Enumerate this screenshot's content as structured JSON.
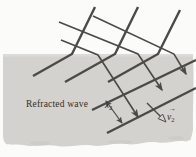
{
  "figure": {
    "background_label": "Refracted wave",
    "wavelength": {
      "symbol": "λ",
      "subscript": "2"
    },
    "velocity": {
      "symbol": "v",
      "subscript": "2",
      "vector_arrow": "→"
    },
    "colors": {
      "medium_fill": "#d3d2ce",
      "medium_top_edge": "#dcdbd7",
      "line": "#4b4a47",
      "text": "#332e28"
    }
  }
}
